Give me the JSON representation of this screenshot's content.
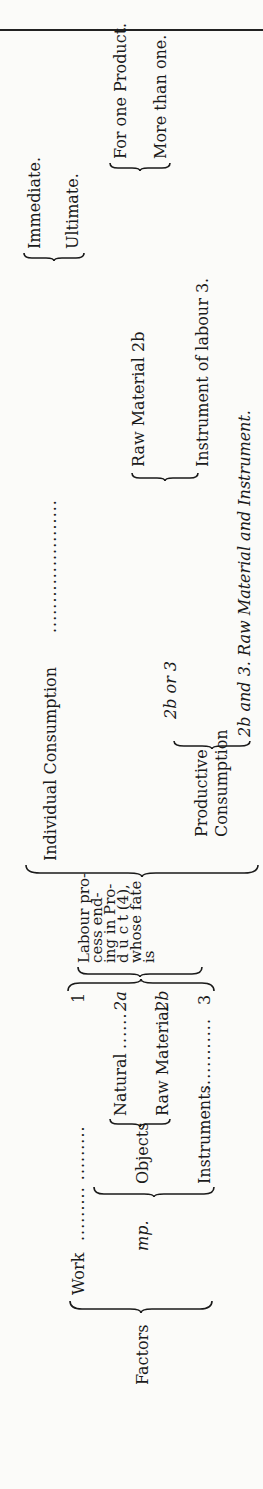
{
  "diagram": {
    "root": "Factors",
    "factors": {
      "work": {
        "label": "Work",
        "leader": ".........  .........",
        "number": "1"
      },
      "mp": {
        "label": "mp."
      },
      "objects": {
        "label": "Objects"
      },
      "natural": {
        "label": "Natural",
        "leader": "......",
        "number": "2a"
      },
      "raw_material": {
        "label": "Raw  Material",
        "number": "2b"
      },
      "instruments": {
        "label": "Instruments",
        "leader": "............",
        "number": "3"
      }
    },
    "labour_process": {
      "lines": [
        "Labour pro-",
        "cess   end-",
        "ing in Pro-",
        "d u c t  (4),",
        "whose fate",
        "is"
      ]
    },
    "individual_consumption": {
      "label": "Individual Consumption",
      "leader": "......................",
      "options": [
        "Immediate.",
        "Ultimate."
      ]
    },
    "productive_consumption": {
      "lines": [
        "Productive",
        "Consumption"
      ],
      "branch_2b_or_3": {
        "label": "2b or 3",
        "raw_material": "Raw Material 2b",
        "raw_material_options": [
          "For one Product.",
          "More than one."
        ],
        "instrument": "Instrument of labour 3."
      },
      "branch_2b_and_3": "2b and 3. Raw Material and Instrument."
    }
  }
}
